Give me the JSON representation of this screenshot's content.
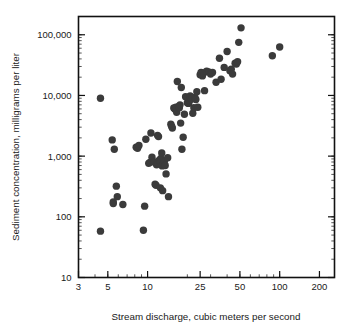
{
  "chart_data": {
    "type": "scatter",
    "title": "",
    "xlabel": "Stream discharge, cubic meters per second",
    "ylabel": "Sediment concentration, milligrams per liter",
    "xscale": "log",
    "yscale": "log",
    "xlim": [
      3,
      260
    ],
    "ylim": [
      10,
      200000
    ],
    "xticks": [
      3,
      5,
      10,
      25,
      50,
      100,
      200
    ],
    "xtick_labels": [
      "3",
      "5",
      "10",
      "25",
      "50",
      "100",
      "200"
    ],
    "yticks": [
      10,
      100,
      1000,
      10000,
      100000
    ],
    "ytick_labels": [
      "10",
      "100",
      "1,000",
      "10,000",
      "100,000"
    ],
    "grid": false,
    "legend": null,
    "marker": {
      "shape": "circle",
      "color": "#3b3b3b",
      "size": 4.6
    },
    "series": [
      {
        "name": "Sediment samples",
        "points": [
          [
            4.4,
            58
          ],
          [
            4.4,
            9000
          ],
          [
            5.4,
            1850
          ],
          [
            5.5,
            175
          ],
          [
            5.5,
            165
          ],
          [
            5.6,
            1300
          ],
          [
            5.8,
            320
          ],
          [
            5.9,
            215
          ],
          [
            6.5,
            160
          ],
          [
            8.2,
            1400
          ],
          [
            8.4,
            1350
          ],
          [
            8.6,
            1500
          ],
          [
            9.3,
            60
          ],
          [
            9.5,
            150
          ],
          [
            9.7,
            1900
          ],
          [
            10.2,
            760
          ],
          [
            10.4,
            790
          ],
          [
            10.6,
            2400
          ],
          [
            10.8,
            960
          ],
          [
            11.2,
            800
          ],
          [
            11.4,
            345
          ],
          [
            11.6,
            330
          ],
          [
            11.7,
            720
          ],
          [
            11.9,
            2200
          ],
          [
            12.0,
            760
          ],
          [
            12.1,
            2100
          ],
          [
            12.2,
            850
          ],
          [
            12.4,
            840
          ],
          [
            12.5,
            300
          ],
          [
            12.6,
            920
          ],
          [
            12.8,
            1130
          ],
          [
            12.9,
            690
          ],
          [
            13.0,
            270
          ],
          [
            13.2,
            760
          ],
          [
            13.4,
            820
          ],
          [
            13.6,
            700
          ],
          [
            13.8,
            510
          ],
          [
            14.2,
            940
          ],
          [
            14.4,
            215
          ],
          [
            15.0,
            3350
          ],
          [
            15.2,
            3100
          ],
          [
            15.4,
            2900
          ],
          [
            15.8,
            6200
          ],
          [
            16.0,
            6100
          ],
          [
            16.2,
            5900
          ],
          [
            16.4,
            6400
          ],
          [
            16.6,
            5300
          ],
          [
            16.8,
            17000
          ],
          [
            17.2,
            6600
          ],
          [
            17.4,
            6300
          ],
          [
            17.6,
            7000
          ],
          [
            17.8,
            3500
          ],
          [
            18.0,
            13500
          ],
          [
            18.2,
            1300
          ],
          [
            18.6,
            2050
          ],
          [
            19.0,
            4900
          ],
          [
            19.4,
            9500
          ],
          [
            20.0,
            7600
          ],
          [
            20.4,
            7400
          ],
          [
            20.8,
            8200
          ],
          [
            21.0,
            9800
          ],
          [
            21.4,
            9200
          ],
          [
            21.6,
            8800
          ],
          [
            22.0,
            5100
          ],
          [
            22.4,
            6300
          ],
          [
            22.8,
            9300
          ],
          [
            23.2,
            8600
          ],
          [
            23.6,
            11500
          ],
          [
            24.0,
            6400
          ],
          [
            25.0,
            22000
          ],
          [
            25.4,
            24000
          ],
          [
            26.0,
            21000
          ],
          [
            26.6,
            23500
          ],
          [
            27.0,
            12000
          ],
          [
            28.0,
            25000
          ],
          [
            29.0,
            24500
          ],
          [
            30.0,
            22500
          ],
          [
            31.0,
            24000
          ],
          [
            33.0,
            16500
          ],
          [
            35.0,
            41000
          ],
          [
            36.0,
            18500
          ],
          [
            38.0,
            29000
          ],
          [
            40.0,
            53000
          ],
          [
            42.0,
            25500
          ],
          [
            43.0,
            27000
          ],
          [
            44.0,
            22500
          ],
          [
            46.0,
            34000
          ],
          [
            47.0,
            33000
          ],
          [
            48.0,
            36000
          ],
          [
            49.0,
            75000
          ],
          [
            51.0,
            130000
          ],
          [
            88.0,
            45000
          ],
          [
            100.0,
            63000
          ]
        ]
      }
    ]
  },
  "axes": {
    "x_title": "Stream discharge, cubic meters per second",
    "y_title": "Sediment concentration, milligrams per liter"
  }
}
